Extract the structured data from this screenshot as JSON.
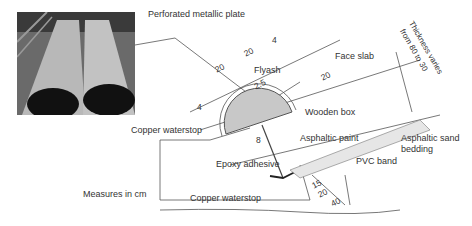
{
  "photo": {
    "alt": "Two half-cylinder perforated metallic plates laid on slope"
  },
  "labels": {
    "perforated_plate": "Perforated metallic plate",
    "flyash": "Flyash",
    "face_slab": "Face slab",
    "thickness_line1": "Thickness varies",
    "thickness_line2": "from 80 to 30",
    "wooden_box": "Wooden box",
    "copper_waterstop_top": "Copper waterstop",
    "asphaltic_paint": "Asphaltic paint",
    "asphaltic_sand_line1": "Asphaltic sand",
    "asphaltic_sand_line2": "bedding",
    "epoxy_adhesive": "Epoxy adhesive",
    "pvc_band": "PVC band",
    "measures": "Measures in cm",
    "copper_waterstop_bottom": "Copper waterstop"
  },
  "dimensions": {
    "d4_left": "4",
    "d20_left": "20",
    "d20_right": "20",
    "d4_right": "4",
    "d2_5": "2.5",
    "d20_slab": "20",
    "d8": "8",
    "d15": "15",
    "d20_bottom": "20",
    "d40": "40"
  },
  "colors": {
    "line": "#555555",
    "fill": "#c8c8c8",
    "dark": "#222222"
  }
}
